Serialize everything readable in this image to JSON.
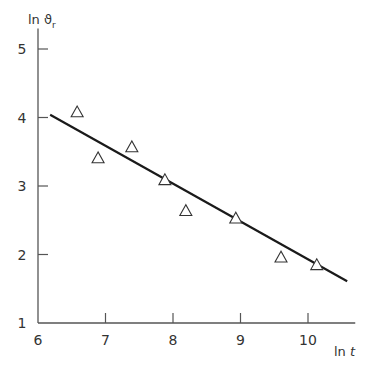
{
  "chart_data": {
    "type": "scatter",
    "title": "",
    "xlabel": "ln t",
    "ylabel": "ln ϑ_r",
    "ylabel_main": "ln ϑ",
    "ylabel_sub": "r",
    "xlabel_main": "ln ",
    "xlabel_italic": "t",
    "xlim": [
      6,
      10.7
    ],
    "ylim": [
      1,
      5.3
    ],
    "x_ticks": [
      6,
      7,
      8,
      9,
      10
    ],
    "y_ticks": [
      1,
      2,
      3,
      4,
      5
    ],
    "grid": false,
    "legend": null,
    "series": [
      {
        "name": "measurements",
        "marker": "open-triangle",
        "points": [
          {
            "x": 6.58,
            "y": 4.08
          },
          {
            "x": 6.89,
            "y": 3.41
          },
          {
            "x": 7.39,
            "y": 3.57
          },
          {
            "x": 7.88,
            "y": 3.09
          },
          {
            "x": 8.19,
            "y": 2.64
          },
          {
            "x": 8.93,
            "y": 2.53
          },
          {
            "x": 9.6,
            "y": 1.96
          },
          {
            "x": 10.13,
            "y": 1.85
          }
        ]
      },
      {
        "name": "fit line",
        "marker": "line",
        "points": [
          {
            "x": 6.18,
            "y": 4.04
          },
          {
            "x": 10.58,
            "y": 1.61
          }
        ]
      }
    ]
  },
  "colors": {
    "axis": "#555555",
    "line": "#1a1a1a",
    "marker": "#333333",
    "text": "#333333"
  }
}
